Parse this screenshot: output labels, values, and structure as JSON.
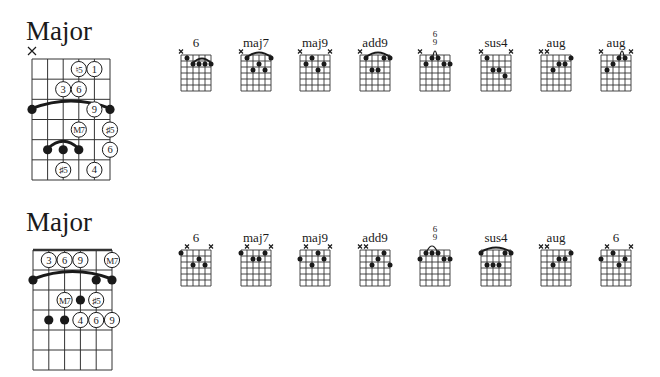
{
  "colors": {
    "ink": "#1a1a1a",
    "grid": "#333333",
    "background": "#ffffff"
  },
  "sections": [
    {
      "title": "Major",
      "big_diagram": {
        "x": 32,
        "y": 59,
        "width": 78,
        "height": 121,
        "strings": 6,
        "frets": 6,
        "nut": false,
        "muted": [
          0
        ],
        "barres": [
          {
            "fret": 3,
            "from": 0,
            "to": 5
          },
          {
            "fret": 5,
            "from": 1,
            "to": 3
          }
        ],
        "dots": [
          {
            "string": 0,
            "fret": 3
          },
          {
            "string": 5,
            "fret": 3
          },
          {
            "string": 1,
            "fret": 5
          },
          {
            "string": 2,
            "fret": 5
          },
          {
            "string": 3,
            "fret": 5
          }
        ],
        "circles": [
          {
            "string": 3,
            "fret": 1,
            "text": "♮5"
          },
          {
            "string": 4,
            "fret": 1,
            "text": "1"
          },
          {
            "string": 2,
            "fret": 2,
            "text": "3"
          },
          {
            "string": 3,
            "fret": 2,
            "text": "6"
          },
          {
            "string": 4,
            "fret": 3,
            "text": "9"
          },
          {
            "string": 3,
            "fret": 4,
            "text": "M7"
          },
          {
            "string": 5,
            "fret": 4,
            "text": "♯5"
          },
          {
            "string": 5,
            "fret": 5,
            "text": "6"
          },
          {
            "string": 2,
            "fret": 6,
            "text": "♯5"
          },
          {
            "string": 4,
            "fret": 6,
            "text": "4"
          }
        ]
      },
      "chords": [
        {
          "name": "6",
          "x": 181,
          "muted": [
            0
          ],
          "open": [],
          "arc": [
            2,
            5
          ],
          "dots": [
            [
              1,
              1
            ],
            [
              2,
              2
            ],
            [
              3,
              2
            ],
            [
              4,
              2
            ],
            [
              5,
              2
            ]
          ]
        },
        {
          "name": "maj7",
          "x": 241,
          "muted": [
            0
          ],
          "open": [],
          "arc": [
            1,
            5
          ],
          "dots": [
            [
              1,
              1
            ],
            [
              5,
              1
            ],
            [
              3,
              2
            ],
            [
              2,
              3
            ],
            [
              4,
              3
            ]
          ]
        },
        {
          "name": "maj9",
          "x": 300,
          "muted": [
            0,
            5
          ],
          "open": [],
          "arc": null,
          "dots": [
            [
              2,
              1
            ],
            [
              1,
              2
            ],
            [
              4,
              2
            ],
            [
              3,
              3
            ]
          ]
        },
        {
          "name": "add9",
          "x": 360,
          "muted": [
            0
          ],
          "open": [],
          "arc": [
            1,
            5
          ],
          "dots": [
            [
              1,
              1
            ],
            [
              4,
              1
            ],
            [
              5,
              1
            ],
            [
              2,
              3
            ],
            [
              3,
              3
            ]
          ]
        },
        {
          "name": "6/9",
          "stack": [
            "6",
            "9"
          ],
          "x": 420,
          "muted": [
            0
          ],
          "open": [],
          "arc": [
            2,
            3
          ],
          "small_arc": true,
          "dots": [
            [
              2,
              1
            ],
            [
              3,
              1
            ],
            [
              1,
              2
            ],
            [
              4,
              2
            ],
            [
              5,
              2
            ]
          ]
        },
        {
          "name": "sus4",
          "x": 481,
          "muted": [
            0,
            5
          ],
          "open": [],
          "arc": null,
          "dots": [
            [
              1,
              1
            ],
            [
              2,
              3
            ],
            [
              3,
              3
            ],
            [
              4,
              4
            ]
          ]
        },
        {
          "name": "aug",
          "x": 541,
          "muted": [
            0,
            1
          ],
          "open": [],
          "arc": null,
          "dots": [
            [
              5,
              1
            ],
            [
              3,
              2
            ],
            [
              4,
              2
            ],
            [
              2,
              3
            ]
          ]
        },
        {
          "name": "aug",
          "x": 601,
          "muted": [
            0,
            5
          ],
          "open": [],
          "arc": [
            3,
            4
          ],
          "small_arc": true,
          "dots": [
            [
              3,
              1
            ],
            [
              4,
              1
            ],
            [
              2,
              2
            ],
            [
              1,
              3
            ]
          ]
        }
      ]
    },
    {
      "title": "Major",
      "big_diagram": {
        "x": 33,
        "y": 250,
        "width": 79,
        "height": 120,
        "strings": 6,
        "frets": 6,
        "nut": true,
        "muted": [],
        "barres": [
          {
            "fret": 2,
            "from": 0,
            "to": 5
          }
        ],
        "dots": [
          {
            "string": 0,
            "fret": 2
          },
          {
            "string": 4,
            "fret": 2
          },
          {
            "string": 5,
            "fret": 2
          },
          {
            "string": 3,
            "fret": 3
          },
          {
            "string": 1,
            "fret": 4
          },
          {
            "string": 2,
            "fret": 4
          }
        ],
        "circles": [
          {
            "string": 1,
            "fret": 1,
            "text": "3"
          },
          {
            "string": 2,
            "fret": 1,
            "text": "6"
          },
          {
            "string": 3,
            "fret": 1,
            "text": "9"
          },
          {
            "string": 5,
            "fret": 1,
            "text": "M7"
          },
          {
            "string": 2,
            "fret": 3,
            "text": "M7"
          },
          {
            "string": 4,
            "fret": 3,
            "text": "♯5"
          },
          {
            "string": 3,
            "fret": 4,
            "text": "4"
          },
          {
            "string": 4,
            "fret": 4,
            "text": "6"
          },
          {
            "string": 5,
            "fret": 4,
            "text": "9"
          }
        ]
      },
      "chords": [
        {
          "name": "6",
          "x": 181,
          "muted": [
            1,
            5
          ],
          "open": [],
          "arc": null,
          "dots": [
            [
              0,
              1
            ],
            [
              3,
              2
            ],
            [
              2,
              3
            ],
            [
              4,
              3
            ]
          ]
        },
        {
          "name": "maj7",
          "x": 241,
          "muted": [
            1,
            5
          ],
          "open": [],
          "arc": null,
          "dots": [
            [
              0,
              1
            ],
            [
              4,
              1
            ],
            [
              2,
              2
            ],
            [
              3,
              2
            ]
          ]
        },
        {
          "name": "maj9",
          "x": 300,
          "muted": [
            1,
            5
          ],
          "open": [],
          "arc": null,
          "dots": [
            [
              3,
              1
            ],
            [
              0,
              2
            ],
            [
              4,
              2
            ],
            [
              2,
              3
            ]
          ]
        },
        {
          "name": "add9",
          "x": 360,
          "muted": [
            0,
            1
          ],
          "open": [],
          "arc": null,
          "dots": [
            [
              4,
              1
            ],
            [
              3,
              2
            ],
            [
              2,
              3
            ],
            [
              5,
              3
            ]
          ]
        },
        {
          "name": "6/9",
          "stack": [
            "6",
            "9"
          ],
          "x": 420,
          "muted": [],
          "open": [],
          "arc": [
            1,
            3
          ],
          "small_arc": true,
          "dots": [
            [
              1,
              1
            ],
            [
              2,
              1
            ],
            [
              3,
              1
            ],
            [
              0,
              2
            ],
            [
              4,
              2
            ],
            [
              5,
              2
            ]
          ]
        },
        {
          "name": "sus4",
          "x": 481,
          "muted": [],
          "open": [],
          "arc": [
            0,
            5
          ],
          "dots": [
            [
              0,
              1
            ],
            [
              4,
              1
            ],
            [
              5,
              1
            ],
            [
              1,
              3
            ],
            [
              2,
              3
            ],
            [
              3,
              3
            ]
          ]
        },
        {
          "name": "aug",
          "x": 541,
          "muted": [
            0,
            1
          ],
          "open": [],
          "arc": null,
          "dots": [
            [
              5,
              1
            ],
            [
              3,
              2
            ],
            [
              4,
              2
            ],
            [
              2,
              3
            ]
          ]
        },
        {
          "name": "6",
          "x": 601,
          "muted": [
            1,
            5
          ],
          "open": [],
          "arc": null,
          "dots": [
            [
              2,
              1
            ],
            [
              0,
              2
            ],
            [
              4,
              2
            ],
            [
              3,
              3
            ]
          ]
        }
      ]
    }
  ]
}
